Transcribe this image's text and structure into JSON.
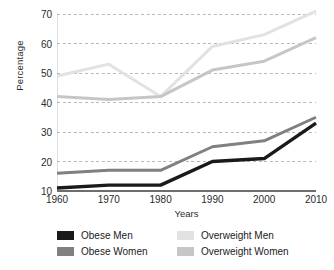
{
  "chart_data": {
    "type": "line",
    "title": "",
    "xlabel": "Years",
    "ylabel": "Percentage",
    "x": [
      1960,
      1970,
      1980,
      1990,
      2000,
      2010
    ],
    "categories": [
      "1960",
      "1970",
      "1980",
      "1990",
      "2000",
      "2010"
    ],
    "xlim": [
      1960,
      2010
    ],
    "ylim": [
      10,
      70
    ],
    "y_ticks": [
      10,
      20,
      30,
      40,
      50,
      60,
      70
    ],
    "x_ticks": [
      "1960",
      "1970",
      "1980",
      "1990",
      "2000",
      "2010"
    ],
    "grid": true,
    "grid_style": "dashed-horizontal",
    "legend_position": "bottom",
    "series": [
      {
        "name": "Obese Men",
        "color": "#1a1a1a",
        "values": [
          11,
          12,
          12,
          20,
          21,
          33
        ]
      },
      {
        "name": "Obese Women",
        "color": "#808080",
        "values": [
          16,
          17,
          17,
          25,
          27,
          35
        ]
      },
      {
        "name": "Overweight Men",
        "color": "#e2e2e2",
        "values": [
          49,
          53,
          42,
          59,
          63,
          71
        ]
      },
      {
        "name": "Overweight Women",
        "color": "#c6c6c6",
        "values": [
          42,
          41,
          42,
          51,
          54,
          62
        ]
      }
    ]
  },
  "axes": {
    "y_title": "Percentage",
    "x_title": "Years",
    "y_tick_labels": [
      "70",
      "60",
      "50",
      "40",
      "30",
      "20",
      "10"
    ],
    "x_tick_labels": [
      "1960",
      "1970",
      "1980",
      "1990",
      "2000",
      "2010"
    ]
  },
  "legend": {
    "items": [
      {
        "label": "Obese Men",
        "color": "#1a1a1a"
      },
      {
        "label": "Overweight Men",
        "color": "#e2e2e2"
      },
      {
        "label": "Obese Women",
        "color": "#808080"
      },
      {
        "label": "Overweight Women",
        "color": "#c6c6c6"
      }
    ]
  },
  "colors": {
    "axis": "#6e6e6e",
    "grid": "#b9b9b9",
    "text": "#1a1a1a",
    "background": "#ffffff"
  }
}
